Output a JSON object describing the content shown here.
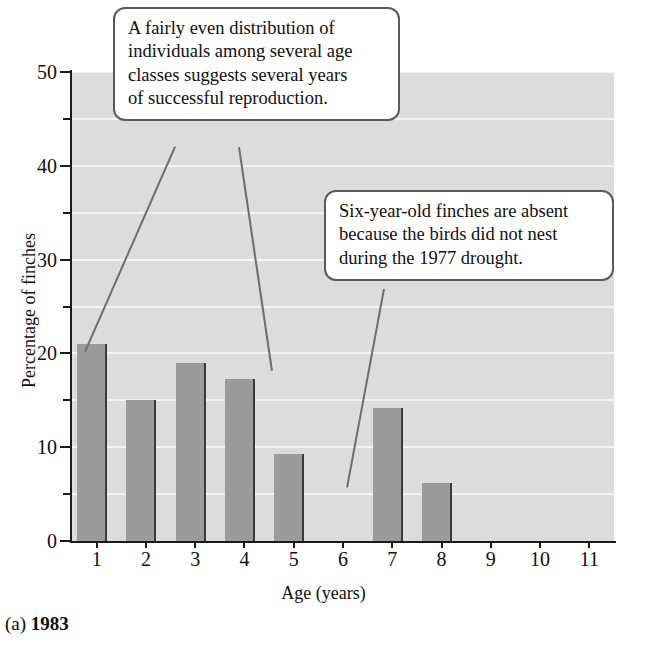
{
  "figure": {
    "caption_prefix": "(a)",
    "caption_year": "1983"
  },
  "chart_data": {
    "type": "bar",
    "title": "",
    "xlabel": "Age (years)",
    "ylabel": "Percentage of finches",
    "categories": [
      "1",
      "2",
      "3",
      "4",
      "5",
      "6",
      "7",
      "8",
      "9",
      "10",
      "11"
    ],
    "values": [
      21,
      15,
      19,
      17.3,
      9.3,
      0,
      14.2,
      6.2,
      0,
      0,
      0
    ],
    "ylim": [
      0,
      50
    ],
    "ytick_labels": [
      "0",
      "10",
      "20",
      "30",
      "40",
      "50"
    ],
    "ytick_values": [
      0,
      10,
      20,
      30,
      40,
      50
    ],
    "yminor_values": [
      5,
      15,
      25,
      35,
      45
    ],
    "gridlines": [
      5,
      10,
      15,
      20,
      25,
      30,
      35,
      40,
      45,
      50
    ],
    "grid": true,
    "legend": "none",
    "colors": {
      "bar_fill": "#9b9b9b",
      "bar_edge": "#3a3a3a",
      "plot_background": "#dcdcdc",
      "gridline": "#f4f4f4",
      "axis": "#1a1a1a",
      "callout_border": "#5a5a5a",
      "leader_line": "#6d6d6d"
    },
    "annotations": [
      {
        "id": "even-distribution-note",
        "text": "A fairly even distribution of individuals among several age classes suggests several years of successful reproduction.",
        "lines": [
          "A fairly even distribution of",
          "individuals among several age",
          "classes suggests several years",
          "of successful reproduction."
        ],
        "points_to": [
          "1",
          "4"
        ]
      },
      {
        "id": "six-year-old-absent-note",
        "text": "Six-year-old finches are absent because the birds did not nest during the 1977 drought.",
        "lines": [
          "Six-year-old finches are absent",
          "because the birds did not nest",
          "during the 1977 drought."
        ],
        "points_to": [
          "6"
        ]
      }
    ]
  }
}
